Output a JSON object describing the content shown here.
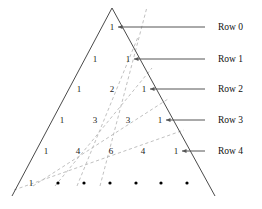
{
  "figure": {
    "type": "pascals-triangle-diagram",
    "apex": {
      "x": 112,
      "y": 8
    },
    "base_left": {
      "x": 12,
      "y": 196
    },
    "base_right": {
      "x": 215,
      "y": 196
    },
    "colors": {
      "triangle_stroke": "#4a4a4a",
      "diagonal_dashed": "#b9b9b9",
      "leader_line": "#555555",
      "text": "#1a1a1a",
      "dot": "#000000",
      "background": "#ffffff"
    },
    "row_spacing_px": 31,
    "col_spacing_px": 32.5
  },
  "triangle": {
    "rows": [
      {
        "index": 0,
        "y": 30,
        "values": [
          "1"
        ],
        "xs": [
          112
        ]
      },
      {
        "index": 1,
        "y": 62,
        "values": [
          "1",
          "1"
        ],
        "xs": [
          95,
          128
        ]
      },
      {
        "index": 2,
        "y": 92,
        "values": [
          "1",
          "2",
          "1"
        ],
        "xs": [
          79,
          112,
          144
        ]
      },
      {
        "index": 3,
        "y": 123,
        "values": [
          "1",
          "3",
          "3",
          "1"
        ],
        "xs": [
          62,
          95,
          128,
          160
        ]
      },
      {
        "index": 4,
        "y": 154,
        "values": [
          "1",
          "4",
          "6",
          "4",
          "1"
        ],
        "xs": [
          46,
          78,
          111,
          143,
          176
        ]
      },
      {
        "index": 5,
        "y": 186,
        "values": [
          "1"
        ],
        "xs": [
          31
        ]
      }
    ]
  },
  "ellipsis_dots": {
    "y": 186,
    "xs": [
      58,
      84,
      110,
      136,
      161,
      187
    ],
    "radius": 1.6,
    "count": 6
  },
  "row_labels": [
    {
      "text": "Row 0",
      "label_x": 218,
      "label_y": 30,
      "line_from_x": 205,
      "line_to_x": 118,
      "arrow_at_x": 118
    },
    {
      "text": "Row 1",
      "label_x": 218,
      "label_y": 62,
      "line_from_x": 205,
      "line_to_x": 134,
      "arrow_at_x": 134
    },
    {
      "text": "Row 2",
      "label_x": 218,
      "label_y": 92,
      "line_from_x": 205,
      "line_to_x": 150,
      "arrow_at_x": 150
    },
    {
      "text": "Row 3",
      "label_x": 218,
      "label_y": 123,
      "line_from_x": 205,
      "line_to_x": 166,
      "arrow_at_x": 166
    },
    {
      "text": "Row 4",
      "label_x": 218,
      "label_y": 154,
      "line_from_x": 205,
      "line_to_x": 182,
      "arrow_at_x": 182
    }
  ],
  "diagonals": [
    {
      "name": "fib-diagonal-1",
      "x1": 100,
      "y1": 186,
      "x2": 147,
      "y2": 7
    },
    {
      "name": "fib-diagonal-2",
      "x1": 77,
      "y1": 186,
      "x2": 138,
      "y2": 37
    },
    {
      "name": "fib-diagonal-3",
      "x1": 55,
      "y1": 186,
      "x2": 152,
      "y2": 68
    },
    {
      "name": "fib-diagonal-4",
      "x1": 33,
      "y1": 186,
      "x2": 168,
      "y2": 99
    },
    {
      "name": "fib-diagonal-5",
      "x1": 14,
      "y1": 190,
      "x2": 184,
      "y2": 130
    }
  ],
  "chart_data": {
    "type": "table",
    "categories": [
      "Row 0",
      "Row 1",
      "Row 2",
      "Row 3",
      "Row 4"
    ],
    "rows": [
      [
        1
      ],
      [
        1,
        1
      ],
      [
        1,
        2,
        1
      ],
      [
        1,
        3,
        3,
        1
      ],
      [
        1,
        4,
        6,
        4,
        1
      ]
    ],
    "partial_next_row": [
      1
    ],
    "annotations": [
      "Row 0",
      "Row 1",
      "Row 2",
      "Row 3",
      "Row 4"
    ],
    "xlabel": "",
    "ylabel": ""
  }
}
